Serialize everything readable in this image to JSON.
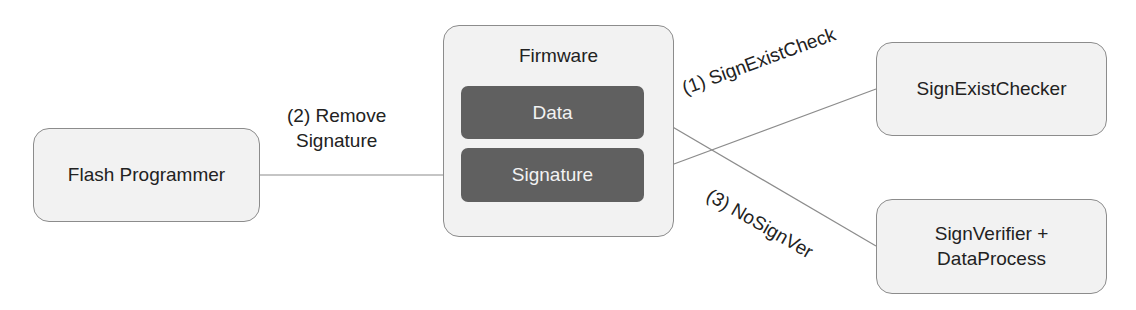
{
  "nodes": {
    "flash_programmer": "Flash Programmer",
    "firmware": {
      "title": "Firmware",
      "data": "Data",
      "signature": "Signature"
    },
    "sign_exist_checker": "SignExistChecker",
    "sign_verifier_line1": "SignVerifier +",
    "sign_verifier_line2": "DataProcess"
  },
  "edges": {
    "remove_line1": "(2) Remove",
    "remove_line2": "Signature",
    "sign_exist_check": "(1) SignExistCheck",
    "no_sign_ver": "(3) NoSignVer"
  },
  "colors": {
    "box_fill": "#f2f2f2",
    "inner_fill": "#606060",
    "line": "#7f7f7f"
  }
}
